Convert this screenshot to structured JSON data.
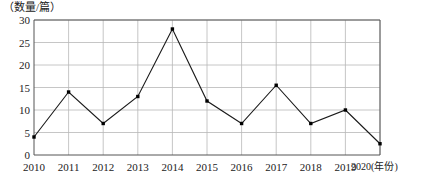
{
  "chart_data": {
    "type": "line",
    "title": "",
    "ylabel": "（数量/篇）",
    "xlabel": "(年份)",
    "categories": [
      "2010",
      "2011",
      "2012",
      "2013",
      "2014",
      "2015",
      "2016",
      "2017",
      "2018",
      "2019",
      "2020"
    ],
    "values": [
      4,
      14,
      7,
      13,
      28,
      12,
      7,
      15.5,
      7,
      10,
      2.5
    ],
    "series": [
      {
        "name": "数量/篇",
        "values": [
          4,
          14,
          7,
          13,
          28,
          12,
          7,
          15.5,
          7,
          10,
          2.5
        ]
      }
    ],
    "ylim": [
      0,
      30
    ],
    "y_ticks": [
      "0",
      "5",
      "10",
      "15",
      "20",
      "25",
      "30"
    ],
    "y_tick_values": [
      0,
      5,
      10,
      15,
      20,
      25,
      30
    ],
    "x_tick_labels": [
      "2010",
      "2011",
      "2012",
      "2013",
      "2014",
      "2015",
      "2016",
      "2017",
      "2018",
      "2019",
      "2020(年份)"
    ],
    "grid": true,
    "legend": "none",
    "line_color": "#1a1a1a",
    "marker_color": "#000000",
    "grid_color": "#b8b8b8",
    "axis_color": "#555555",
    "marker": "square"
  }
}
